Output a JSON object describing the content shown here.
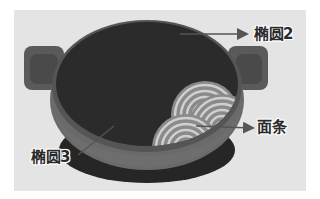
{
  "diagram": {
    "labels": [
      {
        "id": "ellipse2",
        "text": "椭圆2"
      },
      {
        "id": "noodles",
        "text": "面条"
      },
      {
        "id": "ellipse3",
        "text": "椭圆3"
      }
    ],
    "colors": {
      "background": "#e4e4e4",
      "pot_interior": "#2b2b2b",
      "pot_rim": "#6a6a6a",
      "pot_base": "#262626",
      "handle": "#5a5a5a",
      "noodle_light": "#c8c8c8",
      "noodle_dark": "#8a8a8a",
      "arrow": "#555555"
    }
  }
}
